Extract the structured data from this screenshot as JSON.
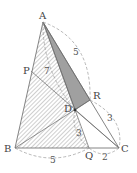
{
  "figure": {
    "points": {
      "A": {
        "label": "A",
        "x": 43,
        "y": 22
      },
      "B": {
        "label": "B",
        "x": 15,
        "y": 148
      },
      "C": {
        "label": "C",
        "x": 119,
        "y": 148
      },
      "P": {
        "label": "P",
        "x": 31,
        "y": 71
      },
      "Q": {
        "label": "Q",
        "x": 89,
        "y": 148
      },
      "R": {
        "label": "R",
        "x": 90,
        "y": 100
      },
      "D": {
        "label": "D",
        "x": 75,
        "y": 110
      }
    },
    "measures": {
      "AR": "5",
      "AD": "7",
      "RC": "3",
      "DQ": "3",
      "BQ": "5",
      "QC": "2"
    },
    "colors": {
      "line": "#666666",
      "shaded": "#999999",
      "hatch": "#777777",
      "dashed": "#999999"
    }
  }
}
